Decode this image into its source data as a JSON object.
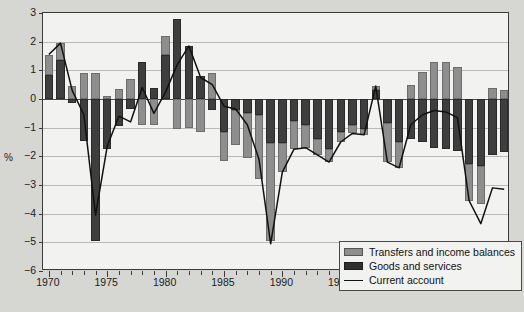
{
  "chart_data": {
    "type": "bar",
    "title": "",
    "subtitle": "",
    "xlabel": "",
    "ylabel": "%",
    "stacked": true,
    "grid": true,
    "legend_position": "bottom-right",
    "ylim": [
      -6,
      3
    ],
    "yticks": [
      3,
      2,
      1,
      0,
      -1,
      -2,
      -3,
      -4,
      -5,
      -6
    ],
    "ytick_labels": [
      "3",
      "2",
      "1",
      "0",
      "−1",
      "−2",
      "−3",
      "−4",
      "−5",
      "−6"
    ],
    "xlim": [
      1969.5,
      2009.5
    ],
    "xtick_labels": [
      "1970",
      "1975",
      "1980",
      "1985",
      "1990",
      "1995",
      "2000",
      "2005"
    ],
    "xtick_values": [
      1970,
      1975,
      1980,
      1985,
      1990,
      1995,
      2000,
      2005
    ],
    "categories": [
      1970,
      1971,
      1972,
      1973,
      1974,
      1975,
      1976,
      1977,
      1978,
      1979,
      1980,
      1981,
      1982,
      1983,
      1984,
      1985,
      1986,
      1987,
      1988,
      1989,
      1990,
      1991,
      1992,
      1993,
      1994,
      1995,
      1996,
      1997,
      1998,
      1999,
      2000,
      2001,
      2002,
      2003,
      2004,
      2005,
      2006,
      2007,
      2008,
      2009
    ],
    "series": [
      {
        "name": "Goods and services",
        "color": "#3e3e3e",
        "values": [
          0.85,
          1.35,
          -0.15,
          -1.45,
          -4.95,
          -1.75,
          -0.95,
          -0.35,
          1.3,
          0.4,
          1.55,
          2.8,
          1.85,
          0.8,
          -0.4,
          -1.15,
          -0.4,
          -0.5,
          -0.55,
          -1.55,
          -1.55,
          -0.75,
          -0.9,
          -1.4,
          -1.75,
          -1.15,
          -0.9,
          -1.05,
          0.3,
          -0.85,
          -1.5,
          -1.4,
          -1.5,
          -1.7,
          -1.75,
          -1.8,
          -2.25,
          -2.35,
          -1.95,
          -1.85
        ]
      },
      {
        "name": "Transfers and income balances",
        "color": "#8e8e8e",
        "values": [
          0.7,
          0.6,
          0.45,
          0.9,
          0.9,
          0.1,
          0.35,
          0.7,
          -0.9,
          -0.9,
          0.65,
          -1.05,
          -1.0,
          -1.15,
          0.9,
          -1.0,
          -1.2,
          -1.55,
          -2.25,
          -3.4,
          -1.0,
          -1.0,
          -0.8,
          -0.55,
          -0.45,
          -0.35,
          -0.3,
          -0.2,
          0.15,
          -1.35,
          -0.9,
          0.5,
          0.95,
          1.3,
          1.3,
          1.1,
          -1.3,
          -1.3,
          0.4,
          0.3
        ]
      }
    ],
    "line_series": {
      "name": "Current account",
      "color": "#111111",
      "values": [
        1.55,
        1.95,
        0.3,
        -0.55,
        -4.05,
        -1.65,
        -0.6,
        -0.8,
        0.4,
        -0.5,
        0.25,
        1.2,
        1.85,
        0.75,
        0.5,
        -0.25,
        -0.35,
        -0.9,
        -2.1,
        -5.05,
        -2.55,
        -1.75,
        -1.7,
        -1.95,
        -2.2,
        -1.5,
        -1.2,
        -1.25,
        0.45,
        -2.2,
        -2.4,
        -0.9,
        -0.55,
        -0.4,
        -0.45,
        -0.65,
        -3.55,
        -4.35,
        -3.1,
        -3.15
      ]
    }
  },
  "legend": {
    "items": [
      {
        "label": "Transfers and income balances",
        "swatch": "transfers"
      },
      {
        "label": "Goods and services",
        "swatch": "goods"
      },
      {
        "label": "Current account",
        "swatch": "line"
      }
    ]
  }
}
